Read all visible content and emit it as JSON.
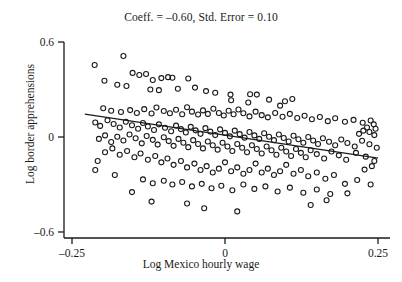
{
  "chart_data": {
    "type": "scatter",
    "title": "Coeff. = –0.60, Std. Error = 0.10",
    "xlabel": "Log Mexico hourly wage",
    "ylabel": "Log border apprehensions",
    "xlim": [
      -0.29,
      0.275
    ],
    "ylim": [
      -0.66,
      0.64
    ],
    "xticks": [
      -0.25,
      0,
      0.25
    ],
    "xticklabels": [
      "–0.25",
      "0",
      "0.25"
    ],
    "yticks": [
      0.6,
      0,
      -0.6
    ],
    "yticklabels": [
      "0.6",
      "0",
      "–0.6"
    ],
    "grid": false,
    "legend": null,
    "marker": {
      "shape": "open-circle",
      "size": 5,
      "edge_color": "#1a1a1a",
      "fill": "none"
    },
    "fit_line": {
      "label": "ols-fit",
      "slope": -0.6,
      "std_error": 0.1,
      "intercept": 0.007,
      "color": "#1a1a1a",
      "x_start": -0.229,
      "x_end": 0.25,
      "y_start": 0.145,
      "y_end": -0.133
    },
    "n_points": 233,
    "points": [
      [
        -0.213,
        0.455
      ],
      [
        -0.166,
        0.512
      ],
      [
        -0.197,
        0.355
      ],
      [
        -0.151,
        0.405
      ],
      [
        -0.14,
        0.392
      ],
      [
        -0.129,
        0.398
      ],
      [
        -0.176,
        0.33
      ],
      [
        -0.161,
        0.322
      ],
      [
        -0.118,
        0.36
      ],
      [
        -0.104,
        0.372
      ],
      [
        -0.093,
        0.378
      ],
      [
        -0.086,
        0.374
      ],
      [
        -0.06,
        0.37
      ],
      [
        -0.122,
        0.3
      ],
      [
        -0.108,
        0.296
      ],
      [
        -0.077,
        0.305
      ],
      [
        -0.049,
        0.312
      ],
      [
        -0.031,
        0.29
      ],
      [
        -0.016,
        0.28
      ],
      [
        0.009,
        0.268
      ],
      [
        0.041,
        0.27
      ],
      [
        0.052,
        0.268
      ],
      [
        0.01,
        0.232
      ],
      [
        0.038,
        0.218
      ],
      [
        0.072,
        0.236
      ],
      [
        0.098,
        0.226
      ],
      [
        0.11,
        0.24
      ],
      [
        0.09,
        0.198
      ],
      [
        -0.199,
        0.182
      ],
      [
        -0.186,
        0.166
      ],
      [
        -0.17,
        0.158
      ],
      [
        -0.155,
        0.17
      ],
      [
        -0.144,
        0.152
      ],
      [
        -0.132,
        0.176
      ],
      [
        -0.12,
        0.148
      ],
      [
        -0.112,
        0.186
      ],
      [
        -0.1,
        0.164
      ],
      [
        -0.09,
        0.15
      ],
      [
        -0.08,
        0.172
      ],
      [
        -0.07,
        0.144
      ],
      [
        -0.062,
        0.188
      ],
      [
        -0.054,
        0.16
      ],
      [
        -0.044,
        0.142
      ],
      [
        -0.036,
        0.168
      ],
      [
        -0.028,
        0.146
      ],
      [
        -0.019,
        0.178
      ],
      [
        -0.01,
        0.152
      ],
      [
        -0.002,
        0.136
      ],
      [
        0.006,
        0.166
      ],
      [
        0.014,
        0.144
      ],
      [
        0.022,
        0.174
      ],
      [
        0.03,
        0.15
      ],
      [
        0.04,
        0.13
      ],
      [
        0.05,
        0.16
      ],
      [
        0.06,
        0.138
      ],
      [
        0.07,
        0.124
      ],
      [
        0.082,
        0.152
      ],
      [
        0.094,
        0.128
      ],
      [
        0.106,
        0.146
      ],
      [
        0.118,
        0.12
      ],
      [
        0.13,
        0.134
      ],
      [
        0.142,
        0.112
      ],
      [
        0.155,
        0.126
      ],
      [
        0.168,
        0.1
      ],
      [
        0.18,
        0.118
      ],
      [
        0.196,
        0.096
      ],
      [
        0.21,
        0.108
      ],
      [
        0.225,
        0.09
      ],
      [
        0.238,
        0.104
      ],
      [
        0.243,
        0.08
      ],
      [
        0.232,
        0.06
      ],
      [
        0.246,
        0.052
      ],
      [
        0.236,
        0.032
      ],
      [
        0.226,
        0.04
      ],
      [
        0.219,
        0.02
      ],
      [
        0.244,
        0.012
      ],
      [
        -0.212,
        0.092
      ],
      [
        -0.204,
        0.07
      ],
      [
        -0.192,
        0.106
      ],
      [
        -0.182,
        0.082
      ],
      [
        -0.172,
        0.06
      ],
      [
        -0.162,
        0.096
      ],
      [
        -0.152,
        0.074
      ],
      [
        -0.142,
        0.052
      ],
      [
        -0.134,
        0.088
      ],
      [
        -0.126,
        0.066
      ],
      [
        -0.116,
        0.044
      ],
      [
        -0.108,
        0.08
      ],
      [
        -0.098,
        0.058
      ],
      [
        -0.088,
        0.036
      ],
      [
        -0.08,
        0.072
      ],
      [
        -0.072,
        0.05
      ],
      [
        -0.064,
        0.028
      ],
      [
        -0.056,
        0.064
      ],
      [
        -0.048,
        0.042
      ],
      [
        -0.04,
        0.02
      ],
      [
        -0.032,
        0.056
      ],
      [
        -0.024,
        0.034
      ],
      [
        -0.016,
        0.012
      ],
      [
        -0.008,
        0.048
      ],
      [
        0.0,
        0.026
      ],
      [
        0.008,
        0.004
      ],
      [
        0.016,
        0.04
      ],
      [
        0.024,
        0.018
      ],
      [
        0.032,
        -0.004
      ],
      [
        0.04,
        0.032
      ],
      [
        0.048,
        0.01
      ],
      [
        0.056,
        -0.012
      ],
      [
        0.064,
        0.024
      ],
      [
        0.072,
        0.002
      ],
      [
        0.08,
        -0.02
      ],
      [
        0.088,
        0.016
      ],
      [
        0.096,
        -0.006
      ],
      [
        0.104,
        -0.028
      ],
      [
        0.112,
        0.008
      ],
      [
        0.12,
        -0.014
      ],
      [
        0.128,
        -0.036
      ],
      [
        0.136,
        0.0
      ],
      [
        0.144,
        -0.022
      ],
      [
        0.152,
        -0.044
      ],
      [
        0.16,
        -0.008
      ],
      [
        0.17,
        -0.03
      ],
      [
        0.18,
        -0.052
      ],
      [
        0.19,
        -0.016
      ],
      [
        0.2,
        -0.038
      ],
      [
        0.212,
        -0.06
      ],
      [
        0.224,
        -0.024
      ],
      [
        0.236,
        -0.046
      ],
      [
        0.248,
        -0.068
      ],
      [
        -0.206,
        -0.012
      ],
      [
        -0.196,
        0.01
      ],
      [
        -0.186,
        -0.032
      ],
      [
        -0.176,
        0.002
      ],
      [
        -0.166,
        -0.022
      ],
      [
        -0.156,
        0.016
      ],
      [
        -0.146,
        -0.008
      ],
      [
        -0.136,
        -0.04
      ],
      [
        -0.128,
        0.006
      ],
      [
        -0.118,
        -0.018
      ],
      [
        -0.11,
        -0.048
      ],
      [
        -0.1,
        -0.002
      ],
      [
        -0.092,
        -0.026
      ],
      [
        -0.084,
        -0.056
      ],
      [
        -0.076,
        -0.012
      ],
      [
        -0.068,
        -0.036
      ],
      [
        -0.06,
        -0.064
      ],
      [
        -0.052,
        -0.02
      ],
      [
        -0.044,
        -0.044
      ],
      [
        -0.036,
        -0.072
      ],
      [
        -0.028,
        -0.028
      ],
      [
        -0.02,
        -0.052
      ],
      [
        -0.012,
        -0.08
      ],
      [
        -0.004,
        -0.036
      ],
      [
        0.004,
        -0.06
      ],
      [
        0.012,
        -0.088
      ],
      [
        0.02,
        -0.044
      ],
      [
        0.028,
        -0.068
      ],
      [
        0.036,
        -0.096
      ],
      [
        0.044,
        -0.052
      ],
      [
        0.052,
        -0.076
      ],
      [
        0.06,
        -0.104
      ],
      [
        0.068,
        -0.06
      ],
      [
        0.076,
        -0.084
      ],
      [
        0.084,
        -0.112
      ],
      [
        0.092,
        -0.068
      ],
      [
        0.1,
        -0.092
      ],
      [
        0.108,
        -0.12
      ],
      [
        0.116,
        -0.076
      ],
      [
        0.124,
        -0.1
      ],
      [
        0.132,
        -0.128
      ],
      [
        0.14,
        -0.084
      ],
      [
        0.15,
        -0.108
      ],
      [
        0.162,
        -0.136
      ],
      [
        0.174,
        -0.092
      ],
      [
        0.186,
        -0.116
      ],
      [
        0.198,
        -0.144
      ],
      [
        0.214,
        -0.1
      ],
      [
        0.23,
        -0.124
      ],
      [
        0.244,
        -0.152
      ],
      [
        0.24,
        -0.184
      ],
      [
        0.228,
        -0.206
      ],
      [
        -0.196,
        -0.096
      ],
      [
        -0.184,
        -0.072
      ],
      [
        -0.172,
        -0.112
      ],
      [
        -0.16,
        -0.088
      ],
      [
        -0.148,
        -0.128
      ],
      [
        -0.138,
        -0.104
      ],
      [
        -0.126,
        -0.144
      ],
      [
        -0.114,
        -0.12
      ],
      [
        -0.104,
        -0.16
      ],
      [
        -0.094,
        -0.136
      ],
      [
        -0.084,
        -0.176
      ],
      [
        -0.072,
        -0.152
      ],
      [
        -0.062,
        -0.192
      ],
      [
        -0.05,
        -0.168
      ],
      [
        -0.04,
        -0.208
      ],
      [
        -0.03,
        -0.184
      ],
      [
        -0.02,
        -0.224
      ],
      [
        -0.01,
        -0.2
      ],
      [
        0.0,
        -0.16
      ],
      [
        0.01,
        -0.216
      ],
      [
        0.02,
        -0.192
      ],
      [
        0.03,
        -0.232
      ],
      [
        0.04,
        -0.208
      ],
      [
        0.05,
        -0.168
      ],
      [
        0.06,
        -0.224
      ],
      [
        0.07,
        -0.2
      ],
      [
        0.08,
        -0.24
      ],
      [
        0.09,
        -0.216
      ],
      [
        0.1,
        -0.176
      ],
      [
        0.112,
        -0.232
      ],
      [
        0.124,
        -0.208
      ],
      [
        0.136,
        -0.248
      ],
      [
        0.15,
        -0.224
      ],
      [
        0.164,
        -0.264
      ],
      [
        0.178,
        -0.24
      ],
      [
        -0.134,
        -0.268
      ],
      [
        -0.118,
        -0.292
      ],
      [
        -0.1,
        -0.276
      ],
      [
        -0.086,
        -0.3
      ],
      [
        -0.07,
        -0.284
      ],
      [
        -0.054,
        -0.312
      ],
      [
        -0.038,
        -0.296
      ],
      [
        -0.022,
        -0.324
      ],
      [
        -0.006,
        -0.308
      ],
      [
        0.012,
        -0.336
      ],
      [
        0.03,
        -0.3
      ],
      [
        0.048,
        -0.328
      ],
      [
        0.066,
        -0.312
      ],
      [
        0.086,
        -0.344
      ],
      [
        0.106,
        -0.32
      ],
      [
        0.128,
        -0.352
      ],
      [
        0.15,
        -0.332
      ],
      [
        0.172,
        -0.36
      ],
      [
        -0.12,
        -0.408
      ],
      [
        -0.062,
        -0.42
      ],
      [
        -0.152,
        -0.348
      ],
      [
        -0.18,
        -0.24
      ],
      [
        -0.208,
        -0.152
      ],
      [
        -0.212,
        -0.208
      ],
      [
        0.196,
        -0.296
      ],
      [
        0.216,
        -0.272
      ],
      [
        0.238,
        -0.3
      ],
      [
        0.2,
        -0.356
      ],
      [
        0.166,
        -0.4
      ],
      [
        -0.034,
        -0.45
      ],
      [
        0.02,
        -0.47
      ],
      [
        0.14,
        -0.43
      ]
    ]
  }
}
